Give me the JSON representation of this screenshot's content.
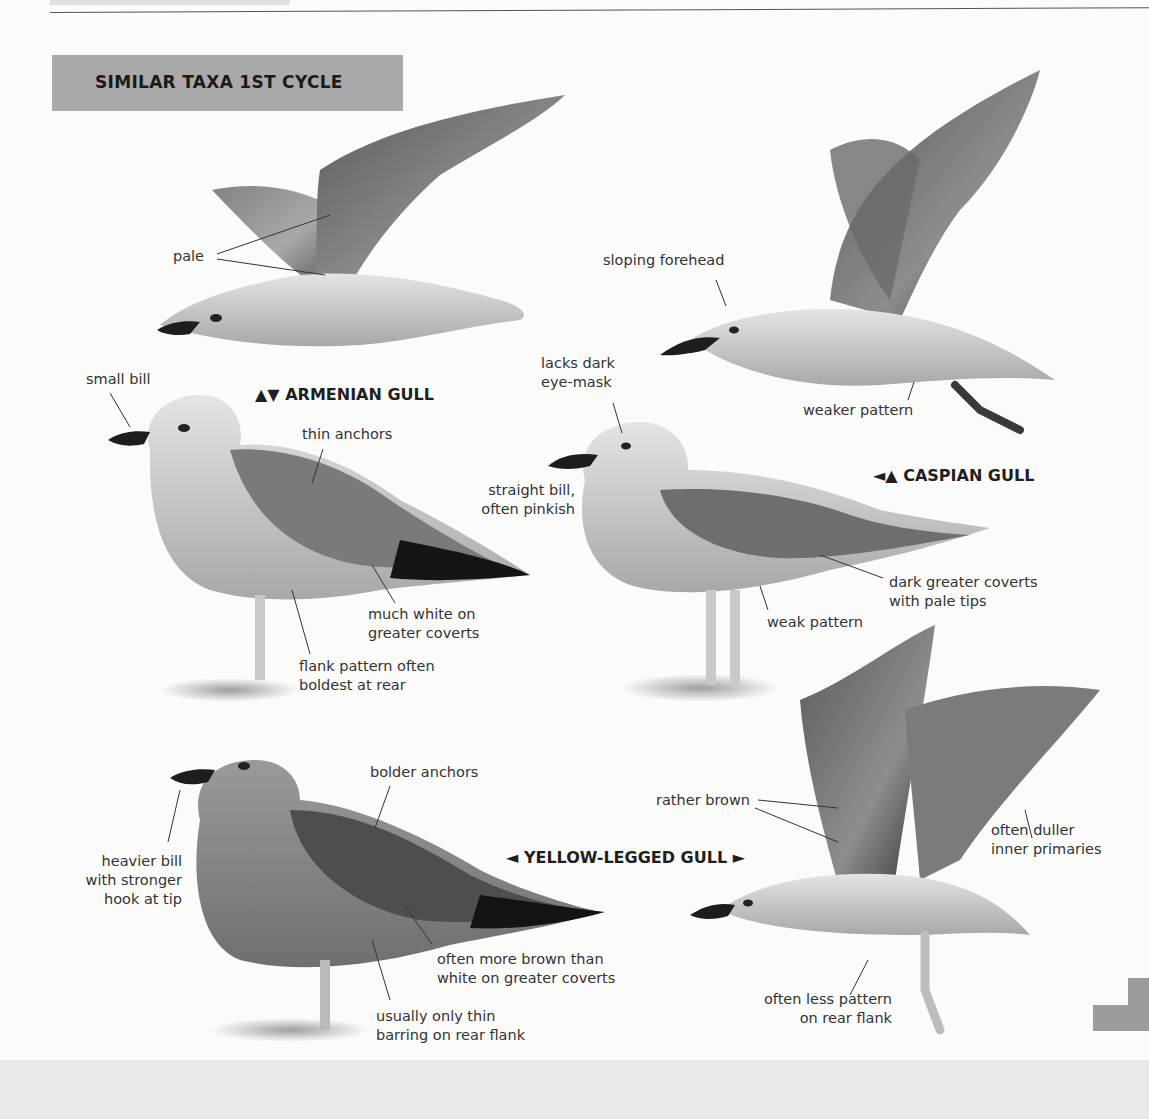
{
  "page": {
    "section_title": "SIMILAR TAXA 1ST CYCLE"
  },
  "species": {
    "armenian": "▲▼ ARMENIAN GULL",
    "caspian": "◄▲ CASPIAN GULL",
    "yellow_legged": "◄ YELLOW-LEGGED GULL ►"
  },
  "labels": {
    "pale": "pale",
    "sloping_forehead": "sloping forehead",
    "small_bill": "small bill",
    "lacks_dark_1": "lacks dark",
    "lacks_dark_2": "eye-mask",
    "weaker_pattern": "weaker pattern",
    "thin_anchors": "thin anchors",
    "straight_bill_1": "straight bill,",
    "straight_bill_2": "often pinkish",
    "dark_gc_1": "dark greater coverts",
    "dark_gc_2": "with pale tips",
    "much_white_1": "much white on",
    "much_white_2": "greater coverts",
    "weak_pattern": "weak pattern",
    "flank_1": "flank pattern often",
    "flank_2": "boldest at rear",
    "bolder_anchors": "bolder anchors",
    "rather_brown": "rather brown",
    "duller_1": "often duller",
    "duller_2": "inner primaries",
    "heavier_1": "heavier bill",
    "heavier_2": "with stronger",
    "heavier_3": "hook at tip",
    "more_brown_1": "often more brown than",
    "more_brown_2": "white on greater coverts",
    "thin_barring_1": "usually only thin",
    "thin_barring_2": "barring on rear flank",
    "less_pattern_1": "often less pattern",
    "less_pattern_2": "on rear flank"
  },
  "colors": {
    "title_box": "#a9a9a9",
    "page": "#fbfbfa",
    "text": "#333333"
  }
}
